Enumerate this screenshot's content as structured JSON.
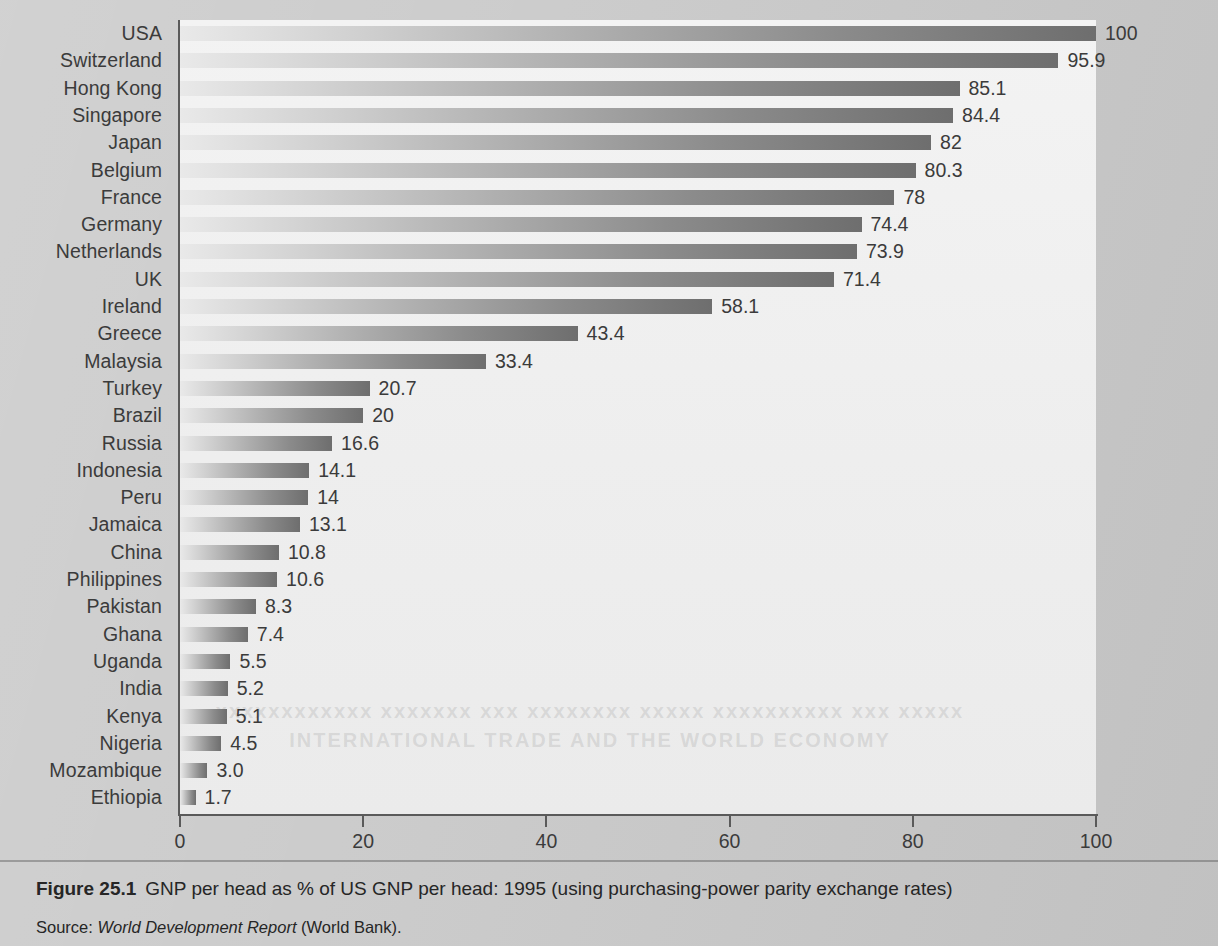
{
  "figure": {
    "number_label": "Figure 25.1",
    "caption": "GNP per head as % of US GNP per head: 1995 (using purchasing-power parity exchange rates)",
    "source_prefix": "Source:",
    "source_italic": "World Development Report",
    "source_suffix": "(World Bank).",
    "showthrough_line1": "xxxxxxxxxxxx xxxxxxx xxx xxxxxxxx xxxxx xxxxxxxxxx xxx xxxxx",
    "showthrough_line2": "INTERNATIONAL TRADE AND THE WORLD ECONOMY"
  },
  "colors": {
    "page_background": "#c9c9c9",
    "plot_background": "#efefef",
    "axis": "#5a5a5a",
    "text": "#3b3b3b",
    "bar_gradient_start": "#e9e9e9",
    "bar_gradient_end": "#6e6e6e"
  },
  "chart_data": {
    "type": "bar",
    "orientation": "horizontal",
    "title": "GNP per head as % of US GNP per head: 1995 (using purchasing-power parity exchange rates)",
    "xlabel": "",
    "ylabel": "",
    "xlim": [
      0,
      100
    ],
    "xticks": [
      0,
      20,
      40,
      60,
      80,
      100
    ],
    "xtick_labels": [
      "0",
      "20",
      "40",
      "60",
      "80",
      "100"
    ],
    "grid": false,
    "legend": null,
    "categories": [
      "USA",
      "Switzerland",
      "Hong Kong",
      "Singapore",
      "Japan",
      "Belgium",
      "France",
      "Germany",
      "Netherlands",
      "UK",
      "Ireland",
      "Greece",
      "Malaysia",
      "Turkey",
      "Brazil",
      "Russia",
      "Indonesia",
      "Peru",
      "Jamaica",
      "China",
      "Philippines",
      "Pakistan",
      "Ghana",
      "Uganda",
      "India",
      "Kenya",
      "Nigeria",
      "Mozambique",
      "Ethiopia"
    ],
    "values": [
      100,
      95.9,
      85.1,
      84.4,
      82,
      80.3,
      78,
      74.4,
      73.9,
      71.4,
      58.1,
      43.4,
      33.4,
      20.7,
      20,
      16.6,
      14.1,
      14,
      13.1,
      10.8,
      10.6,
      8.3,
      7.4,
      5.5,
      5.2,
      5.1,
      4.5,
      3.0,
      1.7
    ],
    "value_labels": [
      "100",
      "95.9",
      "85.1",
      "84.4",
      "82",
      "80.3",
      "78",
      "74.4",
      "73.9",
      "71.4",
      "58.1",
      "43.4",
      "33.4",
      "20.7",
      "20",
      "16.6",
      "14.1",
      "14",
      "13.1",
      "10.8",
      "10.6",
      "8.3",
      "7.4",
      "5.5",
      "5.2",
      "5.1",
      "4.5",
      "3.0",
      "1.7"
    ]
  }
}
